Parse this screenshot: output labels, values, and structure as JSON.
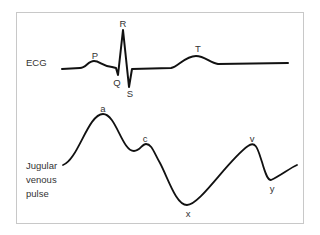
{
  "diagram": {
    "title": "",
    "traces": [
      {
        "id": "ecg",
        "label": "ECG",
        "waves": [
          {
            "name": "P",
            "x": 95,
            "y": 50
          },
          {
            "name": "Q",
            "x": 117,
            "y": 77
          },
          {
            "name": "R",
            "x": 123,
            "y": 18
          },
          {
            "name": "S",
            "x": 130,
            "y": 88
          },
          {
            "name": "T",
            "x": 198,
            "y": 43
          }
        ]
      },
      {
        "id": "jvp",
        "label_lines": [
          "Jugular",
          "venous",
          "pulse"
        ],
        "waves": [
          {
            "name": "a",
            "x": 103,
            "y": 103
          },
          {
            "name": "c",
            "x": 145,
            "y": 133
          },
          {
            "name": "x",
            "x": 188,
            "y": 208
          },
          {
            "name": "v",
            "x": 252,
            "y": 133
          },
          {
            "name": "y",
            "x": 272,
            "y": 183
          }
        ]
      }
    ],
    "colors": {
      "trace": "#111111",
      "frame": "#c8c8c8",
      "text": "#333333"
    }
  }
}
